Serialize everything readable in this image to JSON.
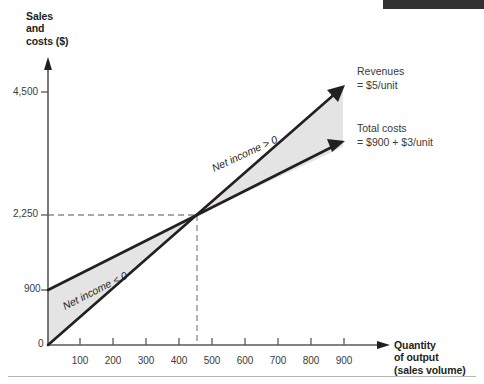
{
  "figure": {
    "y_axis_title_lines": [
      "Sales",
      "and",
      "costs ($)"
    ],
    "x_axis_title_lines": [
      "Quantity",
      "of output",
      "(sales volume)"
    ]
  },
  "annotations": {
    "revenues": {
      "line1": "Revenues",
      "line2": "= $5/unit"
    },
    "total_costs": {
      "line1": "Total costs",
      "line2": "= $900 + $3/unit"
    },
    "loss_region": "Net income < 0",
    "profit_region": "Net income > 0"
  },
  "colors": {
    "line": "#231f20",
    "shaded_region": "#e4e4e4",
    "axis": "#58595b",
    "dashed_guide": "#8c8c8c",
    "top_bar": "#333132",
    "text": "#231f20"
  },
  "chart_data": {
    "type": "line",
    "title": "",
    "xlabel": "Quantity of output (sales volume)",
    "ylabel": "Sales and costs ($)",
    "xlim": [
      0,
      1000
    ],
    "ylim": [
      0,
      5000
    ],
    "grid": false,
    "legend": "inline-annotations",
    "xticks": [
      100,
      200,
      300,
      400,
      500,
      600,
      700,
      800,
      900
    ],
    "xtick_labels": [
      "100",
      "200",
      "300",
      "400",
      "500",
      "600",
      "700",
      "800",
      "900"
    ],
    "yticks": [
      0,
      900,
      2250,
      4500
    ],
    "ytick_labels": [
      "0",
      "900",
      "2,250",
      "4,500"
    ],
    "series": [
      {
        "name": "Revenues",
        "formula": "= $5/unit",
        "slope": 5,
        "intercept": 0,
        "x": [
          0,
          850
        ],
        "values": [
          0,
          4250
        ]
      },
      {
        "name": "Total costs",
        "formula": "= $900 + $3/unit",
        "slope": 3,
        "intercept": 900,
        "x": [
          0,
          850
        ],
        "values": [
          900,
          3450
        ]
      }
    ],
    "breakeven": {
      "quantity": 450,
      "amount": 2250,
      "amount_label": "2,250"
    },
    "regions": [
      {
        "label": "Net income < 0",
        "x_range": [
          0,
          450
        ]
      },
      {
        "label": "Net income > 0",
        "x_range": [
          450,
          850
        ]
      }
    ]
  }
}
